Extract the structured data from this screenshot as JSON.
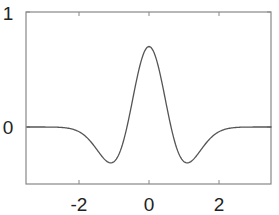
{
  "chart_data": {
    "type": "line",
    "title": "",
    "xlabel": "",
    "ylabel": "",
    "xlim": [
      -3.5,
      3.5
    ],
    "ylim": [
      -0.5,
      1
    ],
    "grid": false,
    "legend": null,
    "x_ticks": [
      -2,
      0,
      2
    ],
    "x_tick_labels": [
      "-2",
      "0",
      "2"
    ],
    "y_ticks": [
      0,
      1
    ],
    "y_tick_labels": [
      "0",
      "1"
    ],
    "series": [
      {
        "name": "wavelet",
        "color": "#555555",
        "x": [
          -3.5,
          -3.0,
          -2.5,
          -2.0,
          -1.75,
          -1.5,
          -1.25,
          -1.09,
          -1.0,
          -0.75,
          -0.6,
          -0.5,
          -0.25,
          0.0,
          0.25,
          0.5,
          0.6,
          0.75,
          1.0,
          1.09,
          1.25,
          1.5,
          1.75,
          2.0,
          2.5,
          3.0,
          3.5
        ],
        "y": [
          0.0,
          -0.0,
          -0.01,
          -0.04,
          -0.08,
          -0.16,
          -0.27,
          -0.31,
          -0.3,
          -0.17,
          -0.02,
          0.14,
          0.51,
          0.7,
          0.51,
          0.14,
          -0.02,
          -0.17,
          -0.3,
          -0.31,
          -0.27,
          -0.16,
          -0.08,
          -0.04,
          -0.01,
          -0.0,
          0.0
        ]
      }
    ]
  },
  "axes": {
    "x_ticks": [
      {
        "value": -2,
        "label": "-2"
      },
      {
        "value": 0,
        "label": "0"
      },
      {
        "value": 2,
        "label": "2"
      }
    ],
    "y_ticks": [
      {
        "value": 0,
        "label": "0"
      },
      {
        "value": 1,
        "label": "1"
      }
    ]
  }
}
